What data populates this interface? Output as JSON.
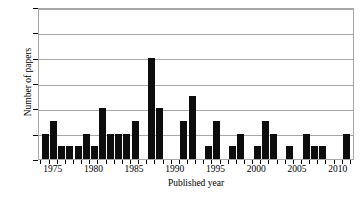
{
  "chart_data": {
    "type": "bar",
    "title": "",
    "xlabel": "Published year",
    "ylabel": "Number of papers",
    "xlim": [
      1973.2,
      1012.0
    ],
    "ylim": [
      0,
      12
    ],
    "ytick_labels": [
      "0",
      "2",
      "4",
      "6",
      "8",
      "10",
      "12"
    ],
    "ytick_values": [
      0,
      2,
      4,
      6,
      8,
      10,
      12
    ],
    "xtick_labels": [
      "1975",
      "1980",
      "1985",
      "1990",
      "1995",
      "2000",
      "2005",
      "2010"
    ],
    "xtick_values": [
      1975,
      1980,
      1985,
      1990,
      1995,
      2000,
      2005,
      2010
    ],
    "grid": "horizontal",
    "legend": "none",
    "bar_color": "#0d0d0d",
    "categories": [
      1974,
      1975,
      1976,
      1977,
      1978,
      1979,
      1980,
      1981,
      1982,
      1983,
      1984,
      1985,
      1986,
      1987,
      1988,
      1989,
      1990,
      1991,
      1992,
      1993,
      1994,
      1995,
      1996,
      1997,
      1998,
      1999,
      2000,
      2001,
      2002,
      2003,
      2004,
      2005,
      2006,
      2007,
      2008,
      2009,
      2010,
      2011
    ],
    "values": [
      2,
      3,
      1,
      1,
      1,
      2,
      1,
      4,
      2,
      2,
      2,
      3,
      0,
      8,
      4,
      0,
      0,
      3,
      5,
      0,
      1,
      3,
      0,
      1,
      2,
      0,
      1,
      3,
      2,
      0,
      1,
      0,
      2,
      1,
      1,
      0,
      0,
      2
    ]
  }
}
